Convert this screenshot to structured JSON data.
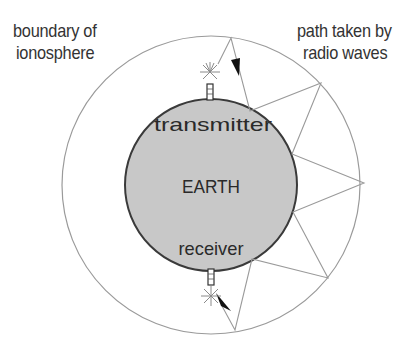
{
  "labels": {
    "ionosphere_line1": "boundary of",
    "ionosphere_line2": "ionosphere",
    "path_line1": "path taken by",
    "path_line2": "radio waves",
    "earth": "EARTH",
    "transmitter": "transmitter",
    "receiver": "receiver"
  },
  "colors": {
    "earth_fill": "#c8c8c8",
    "earth_stroke": "#3a3a3a",
    "ionosphere_stroke": "#9a9a9a",
    "path_stroke": "#9a9a9a",
    "text": "#333333"
  },
  "icons": {
    "transmitter": "antenna-spark-icon",
    "receiver": "antenna-spark-icon",
    "direction_arrow": "arrowhead-icon"
  }
}
